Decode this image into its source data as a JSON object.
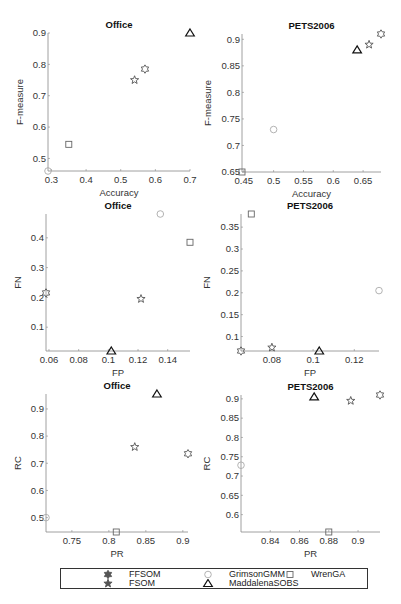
{
  "figure": {
    "legend": {
      "items": [
        {
          "name": "FFSOM",
          "marker": "hexagram",
          "color": "#555555"
        },
        {
          "name": "FSOM",
          "marker": "pentagram",
          "color": "#555555"
        },
        {
          "name": "GrimsonGMM",
          "marker": "circle",
          "color": "#aaaaaa"
        },
        {
          "name": "MaddalenaSOBS",
          "marker": "triangle",
          "color": "#111111"
        },
        {
          "name": "WrenGA",
          "marker": "square",
          "color": "#666666"
        }
      ]
    }
  },
  "chart_data": [
    {
      "type": "scatter",
      "title": "Office",
      "xlabel": "Accuracy",
      "ylabel": "F-measure",
      "xlim": [
        0.29,
        0.7
      ],
      "ylim": [
        0.46,
        0.9
      ],
      "xticks": [
        0.3,
        0.4,
        0.5,
        0.6,
        0.7
      ],
      "xticklabels": [
        "0.3",
        "0.4",
        "0.5",
        "0.6",
        "0.7"
      ],
      "yticks": [
        0.5,
        0.6,
        0.7,
        0.8,
        0.9
      ],
      "yticklabels": [
        "0.5",
        "0.6",
        "0.7",
        "0.8",
        "0.9"
      ],
      "box": {
        "left": 48,
        "top": 33,
        "width": 142,
        "height": 138
      },
      "series": [
        {
          "name": "FFSOM",
          "x": 0.57,
          "y": 0.785
        },
        {
          "name": "FSOM",
          "x": 0.54,
          "y": 0.75
        },
        {
          "name": "GrimsonGMM",
          "x": 0.29,
          "y": 0.46
        },
        {
          "name": "MaddalenaSOBS",
          "x": 0.7,
          "y": 0.9
        },
        {
          "name": "WrenGA",
          "x": 0.35,
          "y": 0.545
        }
      ]
    },
    {
      "type": "scatter",
      "title": "PETS2006",
      "xlabel": "Accuracy",
      "ylabel": "F-measure",
      "xlim": [
        0.447,
        0.68
      ],
      "ylim": [
        0.65,
        0.91
      ],
      "xticks": [
        0.45,
        0.5,
        0.55,
        0.6,
        0.65
      ],
      "xticklabels": [
        "0.45",
        "0.5",
        "0.55",
        "0.6",
        "0.65"
      ],
      "yticks": [
        0.65,
        0.7,
        0.75,
        0.8,
        0.85,
        0.9
      ],
      "yticklabels": [
        "0.65",
        "0.7",
        "0.75",
        "0.8",
        "0.85",
        "0.9"
      ],
      "box": {
        "left": 242,
        "top": 34,
        "width": 139,
        "height": 138
      },
      "series": [
        {
          "name": "FFSOM",
          "x": 0.68,
          "y": 0.91
        },
        {
          "name": "FSOM",
          "x": 0.66,
          "y": 0.89
        },
        {
          "name": "GrimsonGMM",
          "x": 0.5,
          "y": 0.73
        },
        {
          "name": "MaddalenaSOBS",
          "x": 0.64,
          "y": 0.88
        },
        {
          "name": "WrenGA",
          "x": 0.447,
          "y": 0.65
        }
      ]
    },
    {
      "type": "scatter",
      "title": "Office",
      "xlabel": "FP",
      "ylabel": "FN",
      "xlim": [
        0.058,
        0.155
      ],
      "ylim": [
        0.02,
        0.48
      ],
      "xticks": [
        0.06,
        0.08,
        0.1,
        0.12,
        0.14
      ],
      "xticklabels": [
        "0.06",
        "0.08",
        "0.1",
        "0.12",
        "0.14"
      ],
      "yticks": [
        0.1,
        0.2,
        0.3,
        0.4
      ],
      "yticklabels": [
        "0.1",
        "0.2",
        "0.3",
        "0.4"
      ],
      "box": {
        "left": 46,
        "top": 214,
        "width": 144,
        "height": 137
      },
      "series": [
        {
          "name": "FFSOM",
          "x": 0.058,
          "y": 0.215
        },
        {
          "name": "FSOM",
          "x": 0.122,
          "y": 0.195
        },
        {
          "name": "GrimsonGMM",
          "x": 0.135,
          "y": 0.48
        },
        {
          "name": "MaddalenaSOBS",
          "x": 0.102,
          "y": 0.02
        },
        {
          "name": "WrenGA",
          "x": 0.155,
          "y": 0.385
        }
      ]
    },
    {
      "type": "scatter",
      "title": "PETS2006",
      "xlabel": "FP",
      "ylabel": "FN",
      "xlim": [
        0.065,
        0.132
      ],
      "ylim": [
        0.067,
        0.38
      ],
      "xticks": [
        0.08,
        0.1,
        0.12
      ],
      "xticklabels": [
        "0.08",
        "0.1",
        "0.12"
      ],
      "yticks": [
        0.1,
        0.15,
        0.2,
        0.25,
        0.3,
        0.35
      ],
      "yticklabels": [
        "0.1",
        "0.15",
        "0.2",
        "0.25",
        "0.3",
        "0.35"
      ],
      "box": {
        "left": 241,
        "top": 214,
        "width": 138,
        "height": 137
      },
      "series": [
        {
          "name": "FFSOM",
          "x": 0.065,
          "y": 0.067
        },
        {
          "name": "FSOM",
          "x": 0.08,
          "y": 0.075
        },
        {
          "name": "GrimsonGMM",
          "x": 0.132,
          "y": 0.205
        },
        {
          "name": "MaddalenaSOBS",
          "x": 0.103,
          "y": 0.067
        },
        {
          "name": "WrenGA",
          "x": 0.07,
          "y": 0.38
        }
      ]
    },
    {
      "type": "scatter",
      "title": "Office",
      "xlabel": "PR",
      "ylabel": "RC",
      "xlim": [
        0.715,
        0.907
      ],
      "ylim": [
        0.447,
        0.955
      ],
      "xticks": [
        0.75,
        0.8,
        0.85,
        0.9
      ],
      "xticklabels": [
        "0.75",
        "0.8",
        "0.85",
        "0.9"
      ],
      "yticks": [
        0.5,
        0.6,
        0.7,
        0.8,
        0.9
      ],
      "yticklabels": [
        "0.5",
        "0.6",
        "0.7",
        "0.8",
        "0.9"
      ],
      "box": {
        "left": 46,
        "top": 394,
        "width": 142,
        "height": 138
      },
      "series": [
        {
          "name": "FFSOM",
          "x": 0.907,
          "y": 0.735
        },
        {
          "name": "FSOM",
          "x": 0.835,
          "y": 0.76
        },
        {
          "name": "GrimsonGMM",
          "x": 0.715,
          "y": 0.5
        },
        {
          "name": "MaddalenaSOBS",
          "x": 0.865,
          "y": 0.955
        },
        {
          "name": "WrenGA",
          "x": 0.81,
          "y": 0.447
        }
      ]
    },
    {
      "type": "scatter",
      "title": "PETS2006",
      "xlabel": "PR",
      "ylabel": "RC",
      "xlim": [
        0.82,
        0.915
      ],
      "ylim": [
        0.555,
        0.91
      ],
      "xticks": [
        0.84,
        0.86,
        0.88,
        0.9
      ],
      "xticklabels": [
        "0.84",
        "0.86",
        "0.88",
        "0.9"
      ],
      "yticks": [
        0.6,
        0.65,
        0.7,
        0.75,
        0.8,
        0.85,
        0.9
      ],
      "yticklabels": [
        "0.6",
        "0.65",
        "0.7",
        "0.75",
        "0.8",
        "0.85",
        "0.9"
      ],
      "box": {
        "left": 241,
        "top": 395,
        "width": 139,
        "height": 137
      },
      "series": [
        {
          "name": "FFSOM",
          "x": 0.915,
          "y": 0.91
        },
        {
          "name": "FSOM",
          "x": 0.895,
          "y": 0.895
        },
        {
          "name": "GrimsonGMM",
          "x": 0.82,
          "y": 0.728
        },
        {
          "name": "MaddalenaSOBS",
          "x": 0.87,
          "y": 0.905
        },
        {
          "name": "WrenGA",
          "x": 0.88,
          "y": 0.555
        }
      ]
    }
  ]
}
